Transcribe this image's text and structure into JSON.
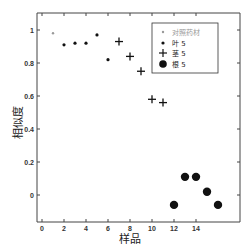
{
  "chart_data": {
    "type": "scatter",
    "title": "",
    "xlabel": "样品",
    "ylabel": "相似度",
    "xlim": [
      -0.5,
      18
    ],
    "ylim": [
      -0.17,
      1.1
    ],
    "x_ticks": [
      "0",
      "2",
      "4",
      "6",
      "8",
      "10",
      "12",
      "14"
    ],
    "y_ticks": [
      "0",
      "0.2",
      "0.4",
      "0.6",
      "0.8",
      "1"
    ],
    "grid": false,
    "legend_position": "upper right",
    "series": [
      {
        "name": "对照药材",
        "marker": "small-dot",
        "color": "#999999",
        "x": [
          1
        ],
        "y": [
          0.98
        ]
      },
      {
        "name": "叶 5",
        "marker": "dot",
        "color": "#111111",
        "x": [
          2,
          3,
          4,
          5,
          6
        ],
        "y": [
          0.91,
          0.92,
          0.92,
          0.97,
          0.82
        ]
      },
      {
        "name": "茎 5",
        "marker": "plus",
        "color": "#111111",
        "x": [
          7,
          8,
          9,
          10,
          11
        ],
        "y": [
          0.93,
          0.84,
          0.75,
          0.58,
          0.56
        ]
      },
      {
        "name": "根 5",
        "marker": "large-circle",
        "color": "#111111",
        "x": [
          12,
          13,
          14,
          15,
          16
        ],
        "y": [
          -0.06,
          0.11,
          0.11,
          0.02,
          -0.06
        ]
      }
    ]
  },
  "legend": {
    "items": [
      {
        "label": "对照药材"
      },
      {
        "label": "叶 5"
      },
      {
        "label": "茎 5"
      },
      {
        "label": "根 5"
      }
    ]
  }
}
